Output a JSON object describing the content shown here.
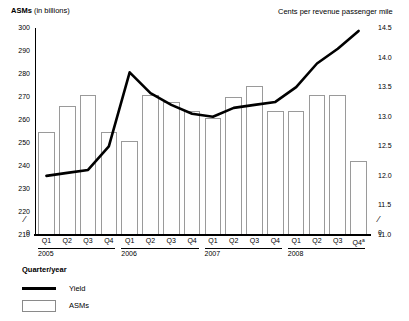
{
  "chart_data": {
    "type": "bar",
    "title": "",
    "subtitle": "",
    "xlabel": "Quarter/year",
    "categories": [
      "Q1",
      "Q2",
      "Q3",
      "Q4",
      "Q1",
      "Q2",
      "Q3",
      "Q4",
      "Q1",
      "Q2",
      "Q3",
      "Q4",
      "Q1",
      "Q2",
      "Q3",
      "Q4"
    ],
    "year_groups": [
      {
        "label": "2005",
        "start": 0,
        "count": 4
      },
      {
        "label": "2006",
        "start": 4,
        "count": 4
      },
      {
        "label": "2007",
        "start": 8,
        "count": 4
      },
      {
        "label": "2008",
        "start": 12,
        "count": 4
      }
    ],
    "footnote_marker_on_last_category": "a",
    "grid": false,
    "legend_position": "below-left",
    "left_axis": {
      "label": "ASMs",
      "label_suffix": "(in billions)",
      "unit": "billions",
      "ticks": [
        210,
        220,
        230,
        240,
        250,
        260,
        270,
        280,
        290,
        300
      ],
      "zero_tick": "0",
      "axis_break": true,
      "ylim": [
        210,
        300
      ]
    },
    "right_axis": {
      "label": "Cents per revenue passenger mile",
      "ticks": [
        11.0,
        11.5,
        12.0,
        12.5,
        13.0,
        13.5,
        14.0,
        14.5
      ],
      "tick_labels": [
        "11.0",
        "11.5",
        "12.0",
        "12.5",
        "13.0",
        "13.5",
        "14.0",
        "14.5"
      ],
      "zero_tick": "0",
      "axis_break": true,
      "ylim": [
        11.0,
        14.5
      ]
    },
    "series": [
      {
        "name": "ASMs",
        "type": "bar",
        "axis": "left",
        "values": [
          255,
          266,
          271,
          255,
          251,
          271,
          268,
          264,
          261,
          270,
          275,
          264,
          264,
          271,
          271,
          242
        ]
      },
      {
        "name": "Yield",
        "type": "line",
        "axis": "right",
        "values": [
          12.0,
          12.05,
          12.1,
          12.5,
          13.75,
          13.4,
          13.2,
          13.05,
          13.0,
          13.15,
          13.2,
          13.25,
          13.5,
          13.9,
          14.15,
          14.45
        ]
      }
    ]
  },
  "legend": {
    "items": [
      {
        "label": "Yield",
        "marker": "line"
      },
      {
        "label": "ASMs",
        "marker": "box"
      }
    ]
  },
  "colors": {
    "yield_line": "#000000",
    "bar_fill": "#ffffff",
    "bar_stroke": "#9a9a9a",
    "axis": "#000000",
    "background": "#ffffff"
  }
}
